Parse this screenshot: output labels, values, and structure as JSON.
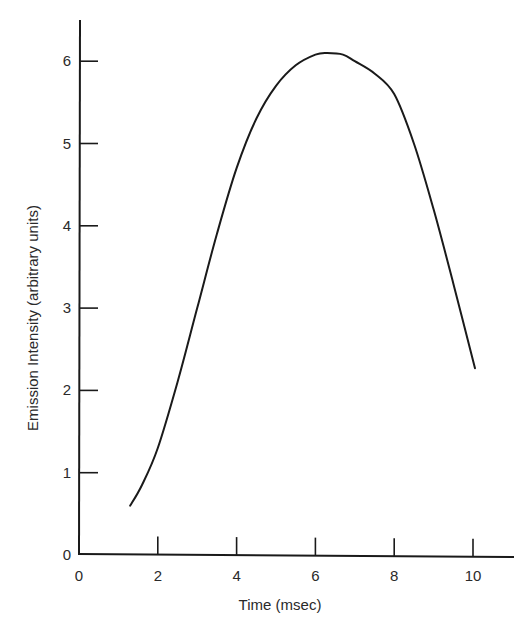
{
  "chart_data": {
    "type": "line",
    "title": "",
    "xlabel": "Time (msec)",
    "ylabel": "Emission Intensity (arbitrary units)",
    "xlim": [
      0,
      11
    ],
    "ylim": [
      0,
      6.5
    ],
    "x_ticks": [
      0,
      2,
      4,
      6,
      8,
      10
    ],
    "y_ticks": [
      0,
      1,
      2,
      3,
      4,
      5,
      6
    ],
    "grid": false,
    "legend": null,
    "series": [
      {
        "name": "Emission intensity",
        "x": [
          1.3,
          1.6,
          2.0,
          2.5,
          3.0,
          3.5,
          4.0,
          4.5,
          5.0,
          5.5,
          6.0,
          6.3,
          6.7,
          7.0,
          7.5,
          8.0,
          8.5,
          9.0,
          9.5,
          10.05
        ],
        "y": [
          0.6,
          0.85,
          1.3,
          2.1,
          3.0,
          3.9,
          4.7,
          5.3,
          5.7,
          5.95,
          6.08,
          6.1,
          6.08,
          6.0,
          5.85,
          5.6,
          5.0,
          4.2,
          3.3,
          2.27
        ]
      }
    ]
  },
  "labels": {
    "xlabel": "Time (msec)",
    "ylabel": "Emission Intensity (arbitrary units)",
    "x_tick_labels": [
      "0",
      "2",
      "4",
      "6",
      "8",
      "10"
    ],
    "y_tick_labels": [
      "0",
      "1",
      "2",
      "3",
      "4",
      "5",
      "6"
    ]
  },
  "colors": {
    "line": "#1a1a1a",
    "axis": "#1a1a1a",
    "background": "#ffffff"
  }
}
